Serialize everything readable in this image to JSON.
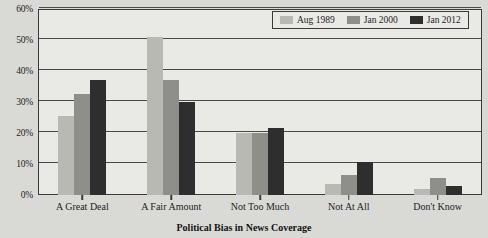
{
  "chart_data": {
    "type": "bar",
    "title": "",
    "xlabel": "Political Bias in News Coverage",
    "ylabel": "",
    "ylim": [
      0,
      60
    ],
    "ytick_labels": [
      "0%",
      "10%",
      "20%",
      "30%",
      "40%",
      "50%",
      "60%"
    ],
    "ytick_values": [
      0,
      10,
      20,
      30,
      40,
      50,
      60
    ],
    "grid": true,
    "legend_position": "top-right",
    "categories": [
      "A Great Deal",
      "A Fair Amount",
      "Not Too Much",
      "Not At All",
      "Don't Know"
    ],
    "series": [
      {
        "name": "Aug 1989",
        "color": "#b9b9b4",
        "values": [
          25.5,
          51,
          20,
          3.5,
          2
        ]
      },
      {
        "name": "Jan 2000",
        "color": "#8e8e8a",
        "values": [
          32.5,
          37,
          20,
          6.5,
          5.5
        ]
      },
      {
        "name": "Jan 2012",
        "color": "#2e2e2e",
        "values": [
          37,
          30,
          21.5,
          10.5,
          3
        ]
      }
    ]
  },
  "colors": {
    "page_background": "#d9d9d6",
    "plot_background": "#e9e9e6",
    "axis": "#3a3a38",
    "gridline": "#4a4a48",
    "text": "#1d1d1d"
  }
}
